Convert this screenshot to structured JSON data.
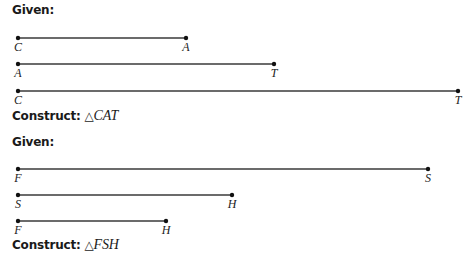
{
  "problems": [
    {
      "given_label": "Given:",
      "construct_label": "Construct:",
      "triangle_symbol": "△",
      "target": "CAT",
      "segments": [
        {
          "start": "C",
          "end": "A",
          "x1": 18,
          "x2": 186,
          "y": 38
        },
        {
          "start": "A",
          "end": "T",
          "x1": 18,
          "x2": 274,
          "y": 64
        },
        {
          "start": "C",
          "end": "T",
          "x1": 18,
          "x2": 458,
          "y": 91
        }
      ]
    },
    {
      "given_label": "Given:",
      "construct_label": "Construct:",
      "triangle_symbol": "△",
      "target": "FSH",
      "segments": [
        {
          "start": "F",
          "end": "S",
          "x1": 18,
          "x2": 428,
          "y": 169
        },
        {
          "start": "S",
          "end": "H",
          "x1": 18,
          "x2": 232,
          "y": 195
        },
        {
          "start": "F",
          "end": "H",
          "x1": 18,
          "x2": 166,
          "y": 221
        }
      ]
    }
  ],
  "colors": {
    "line": "#3a3a3a",
    "text": "#1a1a1a"
  }
}
